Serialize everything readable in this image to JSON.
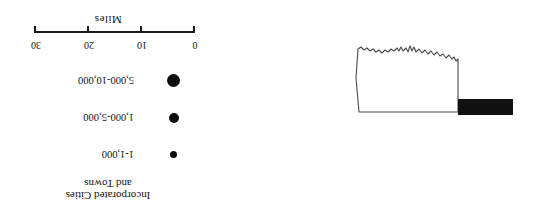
{
  "figure": {
    "rotation_degrees": 180,
    "background_color": "#ffffff",
    "ink_color": "#111111"
  },
  "legend": {
    "title_line1": "Incorporated Cities",
    "title_line2": "and Towns",
    "classes": [
      {
        "label": "1-1,000",
        "dot_diameter_px": 7,
        "color": "#0d0d0d"
      },
      {
        "label": "1,000-5,000",
        "dot_diameter_px": 10,
        "color": "#0d0d0d"
      },
      {
        "label": "5,000-10,000",
        "dot_diameter_px": 13,
        "color": "#0d0d0d"
      }
    ]
  },
  "scalebar": {
    "units_label": "Miles",
    "ticks": [
      "0",
      "10",
      "20",
      "30"
    ],
    "min": 0,
    "max": 30,
    "line_color": "#1a1a1a"
  },
  "map": {
    "name": "state-outline",
    "outline_color": "#4a4a4a",
    "fill_color": "#ffffff",
    "highlight_bar_color": "#111111",
    "highlight_name": "filled-corridor-bar"
  }
}
